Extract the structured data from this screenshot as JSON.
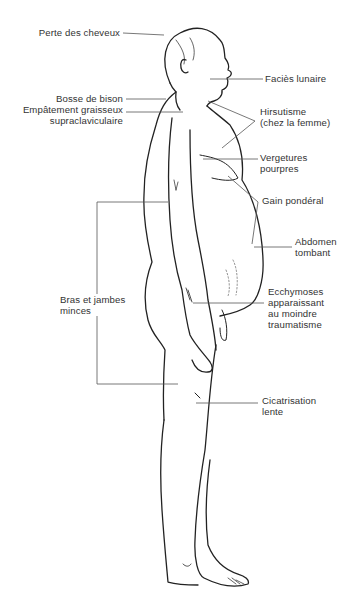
{
  "diagram": {
    "colors": {
      "line": "#222222",
      "pointer": "#555555",
      "text": "#333333",
      "background": "#ffffff"
    },
    "labels": {
      "perte_cheveux": "Perte des cheveux",
      "facies_lunaire": "Faciès lunaire",
      "bosse_bison": "Bosse de bison",
      "empatement_l1": "Empâtement graisseux",
      "empatement_l2": "supraclaviculaire",
      "hirsutisme_l1": "Hirsutisme",
      "hirsutisme_l2": "(chez la femme)",
      "vergetures_l1": "Vergetures",
      "vergetures_l2": "pourpres",
      "gain_ponderal": "Gain pondéral",
      "abdomen_l1": "Abdomen",
      "abdomen_l2": "tombant",
      "bras_l1": "Bras et jambes",
      "bras_l2": "minces",
      "ecchymoses_l1": "Ecchymoses",
      "ecchymoses_l2": "apparaissant",
      "ecchymoses_l3": "au moindre",
      "ecchymoses_l4": "traumatisme",
      "cicatrisation_l1": "Cicatrisation",
      "cicatrisation_l2": "lente"
    }
  }
}
